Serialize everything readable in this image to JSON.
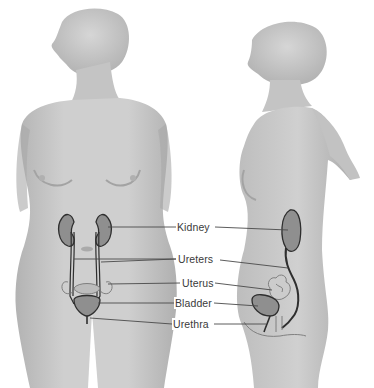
{
  "diagram": {
    "views": [
      "front",
      "side"
    ],
    "labels": [
      {
        "id": "kidney",
        "text": "Kidney"
      },
      {
        "id": "ureters",
        "text": "Ureters"
      },
      {
        "id": "uterus",
        "text": "Uterus"
      },
      {
        "id": "bladder",
        "text": "Bladder"
      },
      {
        "id": "urethra",
        "text": "Urethra"
      }
    ],
    "colors": {
      "background": "#ffffff",
      "skin": "#c9c9c9",
      "skin_shadow": "#a9a9a9",
      "organ_fill": "#8f8f8f",
      "outline": "#2e2e2e",
      "leader_line": "#4a4a4a",
      "label_text": "#3a3a3a"
    }
  }
}
